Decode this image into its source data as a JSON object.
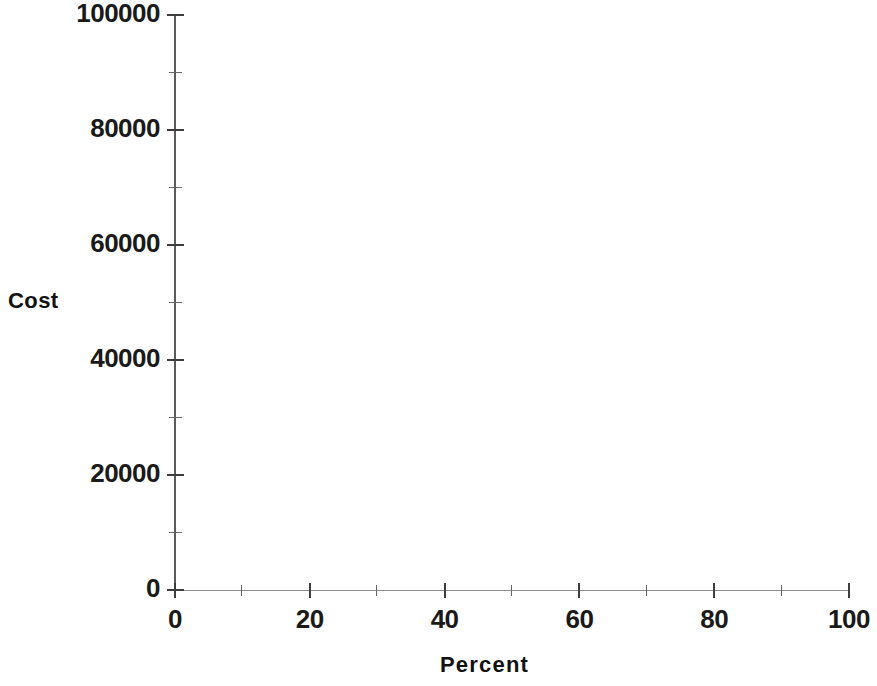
{
  "chart_data": {
    "type": "scatter",
    "title": "",
    "xlabel": "Percent",
    "ylabel": "Cost",
    "xlim": [
      0,
      100
    ],
    "ylim": [
      0,
      100000
    ],
    "grid": false,
    "legend": null,
    "series": [],
    "x": [],
    "values": [],
    "note": "Plot area is empty — no data points, lines, or markers are rendered in the figure.",
    "x_ticks": [
      {
        "value": 0,
        "label": "0",
        "major": true
      },
      {
        "value": 10,
        "label": "",
        "major": false
      },
      {
        "value": 20,
        "label": "20",
        "major": true
      },
      {
        "value": 30,
        "label": "",
        "major": false
      },
      {
        "value": 40,
        "label": "40",
        "major": true
      },
      {
        "value": 50,
        "label": "",
        "major": false
      },
      {
        "value": 60,
        "label": "60",
        "major": true
      },
      {
        "value": 70,
        "label": "",
        "major": false
      },
      {
        "value": 80,
        "label": "80",
        "major": true
      },
      {
        "value": 90,
        "label": "",
        "major": false
      },
      {
        "value": 100,
        "label": "100",
        "major": true
      }
    ],
    "y_ticks": [
      {
        "value": 0,
        "label": "0",
        "major": true
      },
      {
        "value": 10000,
        "label": "",
        "major": false
      },
      {
        "value": 20000,
        "label": "20000",
        "major": true
      },
      {
        "value": 30000,
        "label": "",
        "major": false
      },
      {
        "value": 40000,
        "label": "40000",
        "major": true
      },
      {
        "value": 50000,
        "label": "",
        "major": false
      },
      {
        "value": 60000,
        "label": "60000",
        "major": true
      },
      {
        "value": 70000,
        "label": "",
        "major": false
      },
      {
        "value": 80000,
        "label": "80000",
        "major": true
      },
      {
        "value": 90000,
        "label": "",
        "major": false
      },
      {
        "value": 100000,
        "label": "100000",
        "major": true
      }
    ],
    "colors": {
      "background": "#ffffff",
      "axis": "#3d3d3d",
      "text": "#111111"
    }
  }
}
